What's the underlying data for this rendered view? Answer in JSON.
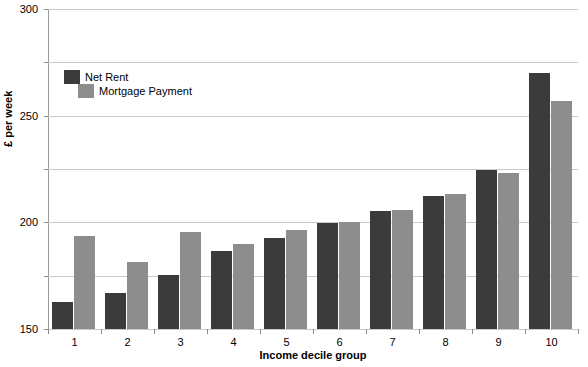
{
  "chart_data": {
    "type": "bar",
    "title": "",
    "xlabel": "Income decile group",
    "ylabel": "£ per week",
    "categories": [
      "1",
      "2",
      "3",
      "4",
      "5",
      "6",
      "7",
      "8",
      "9",
      "10"
    ],
    "series": [
      {
        "name": "Net Rent",
        "color": "#3b3b3b",
        "values": [
          25,
          34,
          51,
          73,
          85,
          99,
          111,
          125,
          149,
          240
        ]
      },
      {
        "name": "Mortgage Payment",
        "color": "#8d8d8d",
        "values": [
          87,
          63,
          91,
          80,
          93,
          100,
          112,
          127,
          146,
          214
        ]
      }
    ],
    "ylim": [
      0,
      300
    ],
    "yticks": [
      0,
      50,
      100,
      150,
      200,
      250,
      300
    ],
    "ytick_labels": [
      "0",
      "50",
      "100",
      "150",
      "200",
      "250",
      "300"
    ],
    "grid": true,
    "legend_position": "upper-left-inside"
  },
  "axis": {
    "y_title": "£ per week",
    "x_title": "Income decile group"
  },
  "legend": {
    "items": [
      {
        "label": "Net Rent"
      },
      {
        "label": "Mortgage Payment"
      }
    ]
  }
}
